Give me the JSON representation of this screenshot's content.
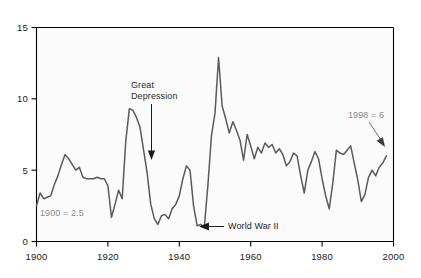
{
  "chart_data": {
    "type": "line",
    "title": "",
    "subtitle": "",
    "xlabel": "",
    "ylabel": "",
    "xlim": [
      1900,
      2000
    ],
    "ylim": [
      0,
      15
    ],
    "grid": false,
    "legend_position": "none",
    "line_color": "#5a5a5a",
    "axis_color": "#000000",
    "background_color": "#ffffff",
    "x_ticks": [
      "1900",
      "1920",
      "1940",
      "1960",
      "1980",
      "2000"
    ],
    "x_tick_values": [
      1900,
      1920,
      1940,
      1960,
      1980,
      2000
    ],
    "y_ticks": [
      "0",
      "5",
      "10",
      "15"
    ],
    "y_tick_values": [
      0,
      5,
      10,
      15
    ],
    "series": [
      {
        "name": "rate",
        "x": [
          1900,
          1901,
          1902,
          1903,
          1904,
          1905,
          1906,
          1907,
          1908,
          1909,
          1910,
          1911,
          1912,
          1913,
          1914,
          1915,
          1916,
          1917,
          1918,
          1919,
          1920,
          1921,
          1922,
          1923,
          1924,
          1925,
          1926,
          1927,
          1928,
          1929,
          1930,
          1931,
          1932,
          1933,
          1934,
          1935,
          1936,
          1937,
          1938,
          1939,
          1940,
          1941,
          1942,
          1943,
          1944,
          1945,
          1946,
          1947,
          1948,
          1949,
          1950,
          1951,
          1952,
          1953,
          1954,
          1955,
          1956,
          1957,
          1958,
          1959,
          1960,
          1961,
          1962,
          1963,
          1964,
          1965,
          1966,
          1967,
          1968,
          1969,
          1970,
          1971,
          1972,
          1973,
          1974,
          1975,
          1976,
          1977,
          1978,
          1979,
          1980,
          1981,
          1982,
          1983,
          1984,
          1985,
          1986,
          1987,
          1988,
          1989,
          1990,
          1991,
          1992,
          1993,
          1994,
          1995,
          1996,
          1997,
          1998
        ],
        "values": [
          2.5,
          3.4,
          3.0,
          3.1,
          3.2,
          4.0,
          4.6,
          5.4,
          6.1,
          5.8,
          5.4,
          5.0,
          5.2,
          4.5,
          4.4,
          4.4,
          4.4,
          4.5,
          4.4,
          4.4,
          3.9,
          1.7,
          2.6,
          3.6,
          3.0,
          7.0,
          9.3,
          9.2,
          8.7,
          8.0,
          6.4,
          4.8,
          2.6,
          1.6,
          1.2,
          1.8,
          1.9,
          1.6,
          2.3,
          2.6,
          3.2,
          4.4,
          5.3,
          5.0,
          2.5,
          1.1,
          1.2,
          1.0,
          3.9,
          7.4,
          9.0,
          12.9,
          9.5,
          8.6,
          7.6,
          8.4,
          7.8,
          7.1,
          5.7,
          7.5,
          6.7,
          5.8,
          6.6,
          6.2,
          6.9,
          6.6,
          6.8,
          6.2,
          6.5,
          6.1,
          5.3,
          5.6,
          6.2,
          6.0,
          4.6,
          3.4,
          5.0,
          5.6,
          6.3,
          5.8,
          4.4,
          3.2,
          2.3,
          4.1,
          6.4,
          6.2,
          6.1,
          6.4,
          6.7,
          5.5,
          4.3,
          2.8,
          3.3,
          4.5,
          5.0,
          4.6,
          5.2,
          5.5,
          6.0
        ]
      }
    ],
    "annotations": [
      {
        "id": "great-depression",
        "line1": "Great",
        "line2": "Depression",
        "text": "Great Depression",
        "target_year": 1932,
        "target_value": 2.6
      },
      {
        "id": "world-war-ii",
        "line1": "World  War  II",
        "line2": "",
        "text": "World War II",
        "target_year": 1945,
        "target_value": 1.1
      },
      {
        "id": "start-value",
        "line1": "1900  =  2.5",
        "line2": "",
        "text": "1900 = 2.5",
        "target_year": 1900,
        "target_value": 2.5
      },
      {
        "id": "end-value",
        "line1": "1998  =  6",
        "line2": "",
        "text": "1998 = 6",
        "target_year": 1998,
        "target_value": 6
      }
    ]
  },
  "axes": {
    "y_tick_0": "0",
    "y_tick_1": "5",
    "y_tick_2": "10",
    "y_tick_3": "15",
    "x_tick_0": "1900",
    "x_tick_1": "1920",
    "x_tick_2": "1940",
    "x_tick_3": "1960",
    "x_tick_4": "1980",
    "x_tick_5": "2000"
  },
  "labels": {
    "great_depression_l1": "Great",
    "great_depression_l2": "Depression",
    "world_war_ii": "World  War  II",
    "start_note": "1900  =  2.5",
    "end_note": "1998  =  6"
  }
}
